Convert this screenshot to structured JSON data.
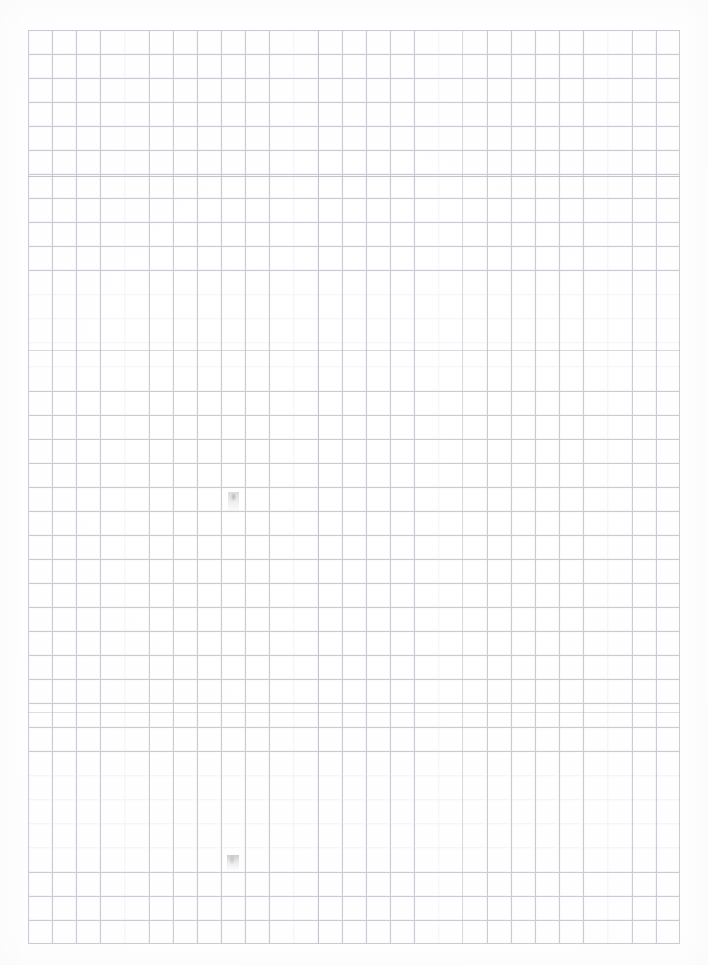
{
  "document": {
    "kind": "scanned-graph-paper",
    "title": "",
    "visible_text": "",
    "background_color": "#ffffff"
  },
  "grid": {
    "line_color": "#c9ccd2",
    "ghost_line_color": "#e2e4e8",
    "emphasis_line_color": "#b6babf",
    "origin_x_px": 28,
    "origin_y_px": 30,
    "width_px": 652,
    "height_px": 914,
    "cell_width_px": 24.15,
    "cell_height_px": 24.05,
    "columns": 27,
    "rows": 38,
    "emphasis_rows_y_px": [
      176,
      350,
      712
    ],
    "emphasis_columns_x_px": [
      318,
      462
    ]
  },
  "marks": [
    {
      "name": "pencil-smudge-upper",
      "x_px": 228,
      "y_px": 492,
      "width_px": 11,
      "height_px": 22,
      "color": "#969699"
    },
    {
      "name": "pencil-smudge-lower",
      "x_px": 227,
      "y_px": 855,
      "width_px": 12,
      "height_px": 16,
      "color": "#9e9ea3"
    }
  ],
  "page": {
    "width_px": 708,
    "height_px": 965
  }
}
